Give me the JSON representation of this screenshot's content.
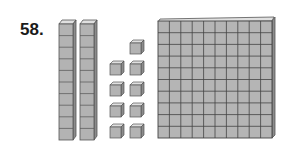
{
  "problem": {
    "number_label": "58."
  },
  "base_ten_blocks": {
    "flats": 1,
    "rods": 2,
    "units": 9,
    "rod_length": 10,
    "flat_size": "10x10",
    "unit_layout": {
      "top_single": 1,
      "rows_of_two": 4
    }
  },
  "colors": {
    "block_fill": "#b3b3b3",
    "block_edge": "#555555",
    "text": "#1a1a1a",
    "background": "#ffffff"
  }
}
